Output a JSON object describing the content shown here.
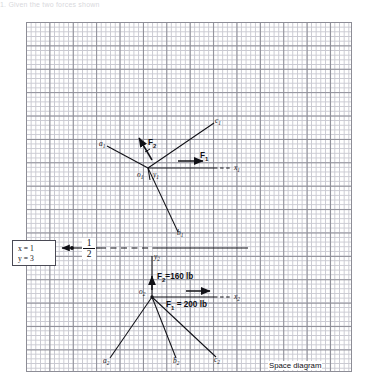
{
  "header_text": "1. Given the two forces shown",
  "caption": "Space diagram",
  "callout": {
    "x_line": "x = 1",
    "y_line": "y = 3"
  },
  "scale_fraction": {
    "numerator": "1",
    "denominator": "2"
  },
  "upper_diagram": {
    "origin_label": "o",
    "origin_sub": "1",
    "axis_x_label": "x",
    "axis_x_sub": "1",
    "axis_y_label": "y",
    "axis_y_sub": "1",
    "ray_a_label": "a",
    "ray_a_sub": "1",
    "ray_b_label": "b",
    "ray_b_sub": "1",
    "ray_c_label": "c",
    "ray_c_sub": "1",
    "force1_label": "F",
    "force1_sub": "1",
    "force2_label": "F",
    "force2_sub": "2"
  },
  "lower_diagram": {
    "origin_label": "o",
    "origin_sub": "2",
    "axis_x_label": "x",
    "axis_x_sub": "2",
    "axis_y_label": "y",
    "axis_y_sub": "2",
    "ray_a_label": "a",
    "ray_a_sub": "2",
    "ray_b_label": "b",
    "ray_b_sub": "2",
    "ray_c_label": "c",
    "ray_c_sub": "2",
    "force1_text": "= 200 lb",
    "force1_label": "F",
    "force1_sub": "1",
    "force2_text": "=160 lb",
    "force2_label": "F",
    "force2_sub": "2"
  },
  "colors": {
    "ink": "#14141a",
    "grid_major": "#8d8d96",
    "grid_minor": "#c9c9d1",
    "paper": "#ffffff"
  }
}
